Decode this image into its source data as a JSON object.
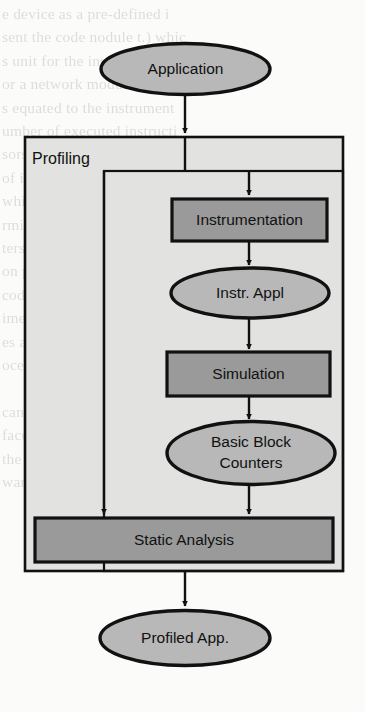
{
  "figure": {
    "type": "flowchart",
    "colors": {
      "page_background": "#fbfbfa",
      "stroke": "#111111",
      "ellipse_fill": "#b8b8b8",
      "process_box_fill": "#9a9a9a",
      "group_fill": "#e2e2e0",
      "text": "#111111"
    }
  },
  "nodes": {
    "application": {
      "label": "Application",
      "shape": "ellipse"
    },
    "instrumentation": {
      "label": "Instrumentation",
      "shape": "rect"
    },
    "instr_appl": {
      "label": "Instr. Appl",
      "shape": "ellipse"
    },
    "simulation": {
      "label": "Simulation",
      "shape": "rect"
    },
    "basic_block_counters": {
      "label_line1": "Basic Block",
      "label_line2": "Counters",
      "shape": "ellipse"
    },
    "static_analysis": {
      "label": "Static Analysis",
      "shape": "rect"
    },
    "profiled_app": {
      "label": "Profiled App.",
      "shape": "ellipse"
    }
  },
  "groups": {
    "profiling": {
      "label": "Profiling"
    }
  },
  "edges": [
    {
      "from": "application",
      "to": "profiling"
    },
    {
      "from": "profiling_split",
      "to": "instrumentation"
    },
    {
      "from": "profiling_split",
      "to": "static_analysis"
    },
    {
      "from": "instrumentation",
      "to": "instr_appl"
    },
    {
      "from": "instr_appl",
      "to": "simulation"
    },
    {
      "from": "simulation",
      "to": "basic_block_counters"
    },
    {
      "from": "basic_block_counters",
      "to": "static_analysis"
    },
    {
      "from": "static_analysis",
      "to": "profiled_app"
    }
  ],
  "background_bleed": {
    "lines": [
      "e device as a pre-defined i",
      "sent the code nodule t.) whic",
      "s unit for the instrumented unit",
      "or a network module equal",
      "s equated to the instrument",
      "umber of executed instructi",
      "sors by applying the mappin",
      "of instrumentation. The consta",
      "which also measures the use of",
      "rmined by measuring the input",
      "ters is determined through simu",
      "on paths occur using a memo",
      "code the histogram analysis c",
      "ime the instructions are exec",
      "es are stored during the profili",
      "ocess is complete, a set of",
      "",
      "can simulation profile of the s",
      "face. If the target hardware p",
      "the application program can a",
      "ware in a processor, they pick"
    ]
  }
}
